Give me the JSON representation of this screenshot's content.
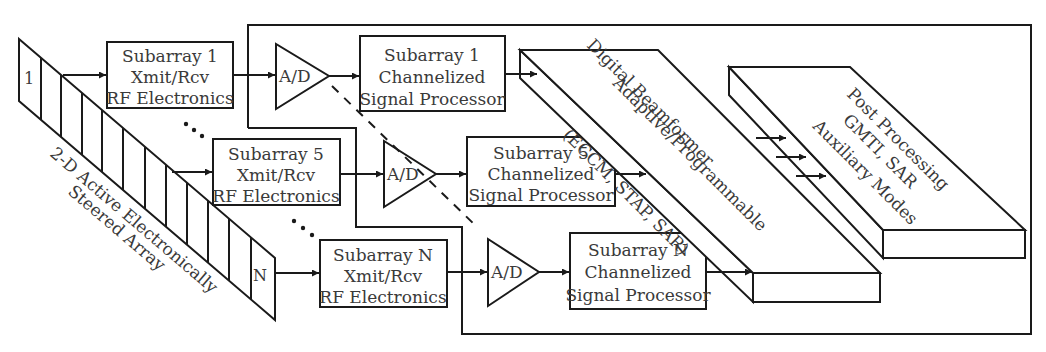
{
  "diagram": {
    "type": "radar signal processing block diagram",
    "array": {
      "label_line1": "2-D Active Electronically",
      "label_line2": "Steered Array",
      "first_element": "1",
      "last_element": "N",
      "element_count_drawn": 9
    },
    "rf_modules": [
      {
        "line1": "Subarray 1",
        "line2": "Xmit/Rcv",
        "line3": "RF Electronics"
      },
      {
        "line1": "Subarray 5",
        "line2": "Xmit/Rcv",
        "line3": "RF Electronics"
      },
      {
        "line1": "Subarray N",
        "line2": "Xmit/Rcv",
        "line3": "RF Electronics"
      }
    ],
    "converters": [
      {
        "label": "A/D"
      },
      {
        "label": "A/D"
      },
      {
        "label": "A/D"
      }
    ],
    "processors": [
      {
        "line1": "Subarray 1",
        "line2": "Channelized",
        "line3": "Signal Processor"
      },
      {
        "line1": "Subarray 5",
        "line2": "Channelized",
        "line3": "Signal Processor"
      },
      {
        "line1": "Subarray N",
        "line2": "Channelized",
        "line3": "Signal Processor"
      }
    ],
    "beamformer": {
      "line1": "Adaptive/Programmable",
      "line2": "Digital Beamformer",
      "line3": "(ECCM, STAP, SAR)"
    },
    "post_processing": {
      "line1": "Post Processing",
      "line2": "GMTI, SAR",
      "line3": "Auxiliary Modes"
    },
    "ellipsis": "..."
  }
}
